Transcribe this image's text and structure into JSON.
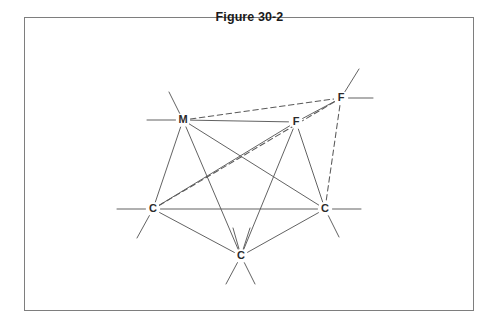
{
  "figure": {
    "title": "Figure 30-2",
    "border_color": "#7e7e7e",
    "bond_color": "#5a5a5a",
    "label_color": "#2b2b2b",
    "background": "#ffffff"
  },
  "atoms": [
    {
      "id": "m1",
      "label": "M",
      "x": 183,
      "y": 120
    },
    {
      "id": "f_ur",
      "label": "F",
      "x": 341,
      "y": 98
    },
    {
      "id": "f_c",
      "label": "F",
      "x": 296,
      "y": 122
    },
    {
      "id": "c_l",
      "label": "C",
      "x": 153,
      "y": 209
    },
    {
      "id": "c_r",
      "label": "C",
      "x": 325,
      "y": 209
    },
    {
      "id": "c_b",
      "label": "C",
      "x": 241,
      "y": 256
    }
  ],
  "bonds": [
    {
      "from": "m1",
      "to": "f_c",
      "style": "solid"
    },
    {
      "from": "m1",
      "to": "f_ur",
      "style": "dashed"
    },
    {
      "from": "m1",
      "to": "c_l",
      "style": "solid"
    },
    {
      "from": "m1",
      "to": "c_b",
      "style": "solid"
    },
    {
      "from": "m1",
      "to": "c_r",
      "style": "solid"
    },
    {
      "from": "f_c",
      "to": "f_ur",
      "style": "solid"
    },
    {
      "from": "f_c",
      "to": "c_l",
      "style": "solid"
    },
    {
      "from": "f_c",
      "to": "c_b",
      "style": "solid"
    },
    {
      "from": "f_c",
      "to": "c_r",
      "style": "solid"
    },
    {
      "from": "f_ur",
      "to": "c_r",
      "style": "dashed"
    },
    {
      "from": "f_ur",
      "to": "c_l",
      "style": "dashed"
    },
    {
      "from": "c_l",
      "to": "c_r",
      "style": "solid"
    },
    {
      "from": "c_l",
      "to": "c_b",
      "style": "solid"
    },
    {
      "from": "c_r",
      "to": "c_b",
      "style": "solid"
    }
  ],
  "stubs": [
    {
      "atom": "m1",
      "dx": -36,
      "dy": 0
    },
    {
      "atom": "m1",
      "dx": -14,
      "dy": -28
    },
    {
      "atom": "f_ur",
      "dx": 32,
      "dy": 0
    },
    {
      "atom": "f_ur",
      "dx": 18,
      "dy": -29
    },
    {
      "atom": "c_l",
      "dx": -36,
      "dy": 0
    },
    {
      "atom": "c_l",
      "dx": -16,
      "dy": 29
    },
    {
      "atom": "c_r",
      "dx": 36,
      "dy": 0
    },
    {
      "atom": "c_r",
      "dx": 14,
      "dy": 28
    },
    {
      "atom": "c_b",
      "dx": -15,
      "dy": 28
    },
    {
      "atom": "c_b",
      "dx": 14,
      "dy": 28
    },
    {
      "atom": "c_b",
      "dx": -8,
      "dy": -28
    },
    {
      "atom": "c_b",
      "dx": 9,
      "dy": -28
    }
  ]
}
